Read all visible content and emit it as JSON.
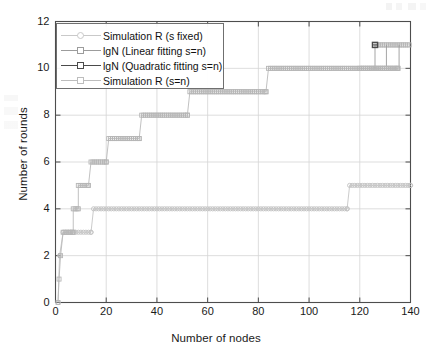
{
  "chart_data": {
    "type": "line",
    "title": "",
    "xlabel": "Number of nodes",
    "ylabel": "Number of rounds",
    "xlim": [
      0,
      140
    ],
    "ylim": [
      0,
      12
    ],
    "xticks": [
      0,
      20,
      40,
      60,
      80,
      100,
      120,
      140
    ],
    "yticks": [
      0,
      2,
      4,
      6,
      8,
      10,
      12
    ],
    "grid": true,
    "legend_position": "upper-left",
    "series": [
      {
        "name": "Simulation R (s fixed)",
        "marker": "circle",
        "color": "#c9c9c9",
        "points": [
          [
            1,
            0
          ],
          [
            2,
            2
          ],
          [
            3,
            3
          ],
          [
            4,
            3
          ],
          [
            5,
            3
          ],
          [
            6,
            3
          ],
          [
            7,
            3
          ],
          [
            8,
            3
          ],
          [
            9,
            3
          ],
          [
            10,
            3
          ],
          [
            11,
            3
          ],
          [
            12,
            3
          ],
          [
            13,
            3
          ],
          [
            14,
            3
          ],
          [
            15,
            4
          ],
          [
            16,
            4
          ],
          [
            18,
            4
          ],
          [
            20,
            4
          ],
          [
            22,
            4
          ],
          [
            25,
            4
          ],
          [
            30,
            4
          ],
          [
            35,
            4
          ],
          [
            40,
            4
          ],
          [
            45,
            4
          ],
          [
            50,
            4
          ],
          [
            55,
            4
          ],
          [
            60,
            4
          ],
          [
            65,
            4
          ],
          [
            70,
            4
          ],
          [
            75,
            4
          ],
          [
            80,
            4
          ],
          [
            85,
            4
          ],
          [
            90,
            4
          ],
          [
            95,
            4
          ],
          [
            100,
            4
          ],
          [
            105,
            4
          ],
          [
            110,
            4
          ],
          [
            114,
            4
          ],
          [
            115,
            4
          ],
          [
            116,
            5
          ],
          [
            118,
            5
          ],
          [
            120,
            5
          ],
          [
            125,
            5
          ],
          [
            130,
            5
          ],
          [
            135,
            5
          ],
          [
            140,
            5
          ]
        ]
      },
      {
        "name": "lgN (Linear fitting s=n)",
        "marker": "square",
        "color": "#a8a8a8",
        "points": [
          [
            1,
            0
          ],
          [
            2,
            1
          ],
          [
            3,
            2
          ],
          [
            4,
            3
          ],
          [
            6,
            3
          ],
          [
            8,
            4
          ],
          [
            10,
            5
          ],
          [
            12,
            5
          ],
          [
            14,
            6
          ],
          [
            16,
            6
          ],
          [
            18,
            6
          ],
          [
            20,
            6
          ],
          [
            21,
            7
          ],
          [
            25,
            7
          ],
          [
            30,
            7
          ],
          [
            33,
            7
          ],
          [
            34,
            8
          ],
          [
            40,
            8
          ],
          [
            45,
            8
          ],
          [
            50,
            8
          ],
          [
            52,
            8
          ],
          [
            53,
            9
          ],
          [
            60,
            9
          ],
          [
            70,
            9
          ],
          [
            80,
            9
          ],
          [
            83,
            9
          ],
          [
            84,
            10
          ],
          [
            90,
            10
          ],
          [
            100,
            10
          ],
          [
            110,
            10
          ],
          [
            120,
            10
          ],
          [
            125,
            10
          ],
          [
            126,
            11
          ],
          [
            128,
            10
          ],
          [
            130,
            11
          ],
          [
            132,
            10
          ],
          [
            135,
            10
          ],
          [
            136,
            11
          ],
          [
            140,
            11
          ]
        ]
      },
      {
        "name": "lgN (Quadratic fitting s=n)",
        "marker": "square-filled",
        "color": "#555555",
        "points": [
          [
            1,
            0
          ],
          [
            2,
            1
          ],
          [
            3,
            2
          ],
          [
            4,
            3
          ],
          [
            6,
            3
          ],
          [
            8,
            4
          ],
          [
            10,
            5
          ],
          [
            12,
            5
          ],
          [
            14,
            6
          ],
          [
            16,
            6
          ],
          [
            18,
            6
          ],
          [
            20,
            6
          ],
          [
            21,
            7
          ],
          [
            25,
            7
          ],
          [
            30,
            7
          ],
          [
            33,
            7
          ],
          [
            34,
            8
          ],
          [
            40,
            8
          ],
          [
            45,
            8
          ],
          [
            50,
            8
          ],
          [
            52,
            8
          ],
          [
            53,
            9
          ],
          [
            60,
            9
          ],
          [
            70,
            9
          ],
          [
            80,
            9
          ],
          [
            83,
            9
          ],
          [
            84,
            10
          ],
          [
            90,
            10
          ],
          [
            100,
            10
          ],
          [
            110,
            10
          ],
          [
            120,
            10
          ],
          [
            125,
            10
          ],
          [
            126,
            11
          ],
          [
            130,
            11
          ],
          [
            136,
            11
          ],
          [
            140,
            11
          ]
        ]
      },
      {
        "name": "Simulation R (s=n)",
        "marker": "square",
        "color": "#bdbdbd",
        "points": [
          [
            1,
            0
          ],
          [
            2,
            1
          ],
          [
            3,
            2
          ],
          [
            4,
            3
          ],
          [
            6,
            3
          ],
          [
            8,
            4
          ],
          [
            10,
            5
          ],
          [
            12,
            5
          ],
          [
            14,
            6
          ],
          [
            16,
            6
          ],
          [
            18,
            6
          ],
          [
            20,
            6
          ],
          [
            21,
            7
          ],
          [
            25,
            7
          ],
          [
            30,
            7
          ],
          [
            33,
            7
          ],
          [
            34,
            8
          ],
          [
            40,
            8
          ],
          [
            45,
            8
          ],
          [
            50,
            8
          ],
          [
            52,
            8
          ],
          [
            53,
            9
          ],
          [
            60,
            9
          ],
          [
            70,
            9
          ],
          [
            80,
            9
          ],
          [
            83,
            9
          ],
          [
            84,
            10
          ],
          [
            90,
            10
          ],
          [
            100,
            10
          ],
          [
            110,
            10
          ],
          [
            120,
            10
          ],
          [
            125,
            10
          ],
          [
            126,
            11
          ],
          [
            130,
            11
          ],
          [
            136,
            11
          ],
          [
            140,
            11
          ]
        ]
      }
    ],
    "step_levels_upper": [
      {
        "level": 3,
        "x_from": 3,
        "x_to": 7
      },
      {
        "level": 4,
        "x_from": 7,
        "x_to": 9
      },
      {
        "level": 5,
        "x_from": 9,
        "x_to": 13
      },
      {
        "level": 6,
        "x_from": 14,
        "x_to": 20
      },
      {
        "level": 7,
        "x_from": 21,
        "x_to": 33
      },
      {
        "level": 8,
        "x_from": 34,
        "x_to": 52
      },
      {
        "level": 9,
        "x_from": 53,
        "x_to": 83
      },
      {
        "level": 10,
        "x_from": 84,
        "x_to": 135
      },
      {
        "level": 11,
        "x_from": 126,
        "x_to": 140
      }
    ],
    "step_levels_lower": [
      {
        "level": 0,
        "x_from": 1,
        "x_to": 1
      },
      {
        "level": 2,
        "x_from": 2,
        "x_to": 2
      },
      {
        "level": 3,
        "x_from": 3,
        "x_to": 14
      },
      {
        "level": 4,
        "x_from": 15,
        "x_to": 115
      },
      {
        "level": 5,
        "x_from": 116,
        "x_to": 140
      }
    ]
  },
  "legend": {
    "items": [
      {
        "label": "Simulation R (s fixed)",
        "marker": "circle",
        "color": "#c9c9c9"
      },
      {
        "label": "lgN (Linear fitting s=n)",
        "marker": "square",
        "color": "#9c9c9c"
      },
      {
        "label": "lgN (Quadratic fitting s=n)",
        "marker": "square-filled",
        "color": "#4a4a4a"
      },
      {
        "label": "Simulation R (s=n)",
        "marker": "square",
        "color": "#bdbdbd"
      }
    ]
  },
  "axes": {
    "xlabel": "Number of nodes",
    "ylabel": "Number of rounds",
    "xticks": [
      "0",
      "20",
      "40",
      "60",
      "80",
      "100",
      "120",
      "140"
    ],
    "yticks": [
      "0",
      "2",
      "4",
      "6",
      "8",
      "10",
      "12"
    ]
  },
  "colors": {
    "axis": "#4d4d4d",
    "grid": "#d4d4d4",
    "text": "#1a1a1a",
    "background": "#ffffff"
  }
}
